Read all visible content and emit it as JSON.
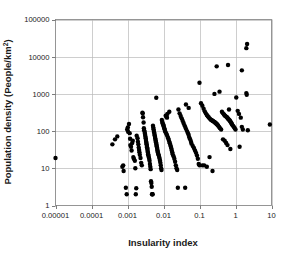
{
  "chart_data": {
    "type": "scatter",
    "title": "",
    "xlabel": "Insularity index",
    "ylabel": "Population density (People/km²)",
    "ylabel_base": "Population density (People/km",
    "ylabel_sup": "2",
    "ylabel_tail": ")",
    "xscale": "log",
    "yscale": "log",
    "xlim": [
      1e-05,
      10
    ],
    "ylim": [
      1,
      100000
    ],
    "grid": true,
    "legend": null,
    "xticks": [
      1e-05,
      0.0001,
      0.001,
      0.01,
      0.1,
      1,
      10
    ],
    "xtick_labels": [
      "0.00001",
      "0.0001",
      "0.001",
      "0.01",
      "0.1",
      "1",
      "10"
    ],
    "yticks": [
      1,
      10,
      100,
      1000,
      10000,
      100000
    ],
    "ytick_labels": [
      "1",
      "10",
      "100",
      "1000",
      "10000",
      "100000"
    ],
    "marker": "filled-circle",
    "marker_color": "#000000",
    "marker_size_px": 4.4,
    "n_points": 232,
    "points": [
      [
        1e-05,
        19
      ],
      [
        0.00038,
        44
      ],
      [
        0.00045,
        60
      ],
      [
        0.00052,
        72
      ],
      [
        0.00072,
        11
      ],
      [
        0.00076,
        12
      ],
      [
        0.00078,
        8.5
      ],
      [
        0.0009,
        3.0
      ],
      [
        0.00095,
        2.0
      ],
      [
        0.00098,
        110
      ],
      [
        0.00102,
        125
      ],
      [
        0.00104,
        96
      ],
      [
        0.0011,
        155
      ],
      [
        0.00115,
        88
      ],
      [
        0.00118,
        62
      ],
      [
        0.0012,
        42
      ],
      [
        0.00125,
        38
      ],
      [
        0.0013,
        30
      ],
      [
        0.00135,
        48
      ],
      [
        0.0014,
        55
      ],
      [
        0.00145,
        20
      ],
      [
        0.0015,
        18
      ],
      [
        0.0016,
        16
      ],
      [
        0.00165,
        10
      ],
      [
        0.0017,
        2.0
      ],
      [
        0.00175,
        2.9
      ],
      [
        0.0018,
        75
      ],
      [
        0.0019,
        64
      ],
      [
        0.00195,
        52
      ],
      [
        0.002,
        44
      ],
      [
        0.00205,
        36
      ],
      [
        0.0021,
        31
      ],
      [
        0.00215,
        27
      ],
      [
        0.0022,
        23
      ],
      [
        0.0023,
        19
      ],
      [
        0.0024,
        14
      ],
      [
        0.0025,
        12
      ],
      [
        0.0026,
        310
      ],
      [
        0.00265,
        300
      ],
      [
        0.0027,
        235
      ],
      [
        0.0028,
        170
      ],
      [
        0.00285,
        120
      ],
      [
        0.0029,
        105
      ],
      [
        0.003,
        95
      ],
      [
        0.00305,
        85
      ],
      [
        0.0031,
        78
      ],
      [
        0.00315,
        70
      ],
      [
        0.0032,
        64
      ],
      [
        0.00325,
        58
      ],
      [
        0.0033,
        52
      ],
      [
        0.00335,
        48
      ],
      [
        0.0034,
        44
      ],
      [
        0.00345,
        40
      ],
      [
        0.0035,
        37
      ],
      [
        0.00355,
        34
      ],
      [
        0.0036,
        31
      ],
      [
        0.00365,
        28
      ],
      [
        0.0037,
        26
      ],
      [
        0.00375,
        24
      ],
      [
        0.0038,
        22
      ],
      [
        0.0039,
        20
      ],
      [
        0.004,
        18
      ],
      [
        0.0041,
        16
      ],
      [
        0.0042,
        13
      ],
      [
        0.0043,
        11
      ],
      [
        0.0044,
        9.5
      ],
      [
        0.0045,
        4.5
      ],
      [
        0.0046,
        4.0
      ],
      [
        0.0047,
        3.2
      ],
      [
        0.0048,
        2.0
      ],
      [
        0.0049,
        2.0
      ],
      [
        0.005,
        2.0
      ],
      [
        0.0051,
        140
      ],
      [
        0.0052,
        125
      ],
      [
        0.0053,
        112
      ],
      [
        0.0054,
        100
      ],
      [
        0.0055,
        92
      ],
      [
        0.0056,
        84
      ],
      [
        0.0057,
        76
      ],
      [
        0.0058,
        70
      ],
      [
        0.0059,
        64
      ],
      [
        0.006,
        58
      ],
      [
        0.0061,
        54
      ],
      [
        0.0062,
        50
      ],
      [
        0.0063,
        46
      ],
      [
        0.0064,
        42
      ],
      [
        0.0065,
        39
      ],
      [
        0.0066,
        36
      ],
      [
        0.0067,
        33
      ],
      [
        0.0068,
        30
      ],
      [
        0.0069,
        28
      ],
      [
        0.007,
        26
      ],
      [
        0.0072,
        24
      ],
      [
        0.0074,
        22
      ],
      [
        0.0076,
        20
      ],
      [
        0.0078,
        18
      ],
      [
        0.008,
        16
      ],
      [
        0.0082,
        14
      ],
      [
        0.0084,
        12
      ],
      [
        0.0086,
        10
      ],
      [
        0.0088,
        9.0
      ],
      [
        0.0063,
        790
      ],
      [
        0.009,
        200
      ],
      [
        0.0092,
        175
      ],
      [
        0.0095,
        160
      ],
      [
        0.0098,
        150
      ],
      [
        0.01,
        142
      ],
      [
        0.0102,
        130
      ],
      [
        0.0105,
        120
      ],
      [
        0.0108,
        110
      ],
      [
        0.011,
        100
      ],
      [
        0.0115,
        92
      ],
      [
        0.012,
        85
      ],
      [
        0.0125,
        78
      ],
      [
        0.013,
        70
      ],
      [
        0.0135,
        64
      ],
      [
        0.014,
        58
      ],
      [
        0.0145,
        52
      ],
      [
        0.015,
        47
      ],
      [
        0.0155,
        42
      ],
      [
        0.016,
        38
      ],
      [
        0.0165,
        34
      ],
      [
        0.017,
        30
      ],
      [
        0.0175,
        27
      ],
      [
        0.018,
        24
      ],
      [
        0.019,
        21
      ],
      [
        0.02,
        18
      ],
      [
        0.021,
        15
      ],
      [
        0.022,
        12
      ],
      [
        0.023,
        10
      ],
      [
        0.024,
        9.0
      ],
      [
        0.0115,
        260
      ],
      [
        0.012,
        245
      ],
      [
        0.0125,
        230
      ],
      [
        0.0128,
        290
      ],
      [
        0.0145,
        330
      ],
      [
        0.025,
        3.0
      ],
      [
        0.04,
        3.0
      ],
      [
        0.026,
        380
      ],
      [
        0.028,
        300
      ],
      [
        0.03,
        255
      ],
      [
        0.032,
        220
      ],
      [
        0.034,
        190
      ],
      [
        0.036,
        165
      ],
      [
        0.038,
        145
      ],
      [
        0.04,
        130
      ],
      [
        0.042,
        115
      ],
      [
        0.045,
        100
      ],
      [
        0.048,
        88
      ],
      [
        0.05,
        78
      ],
      [
        0.052,
        68
      ],
      [
        0.055,
        60
      ],
      [
        0.058,
        52
      ],
      [
        0.06,
        46
      ],
      [
        0.065,
        40
      ],
      [
        0.07,
        35
      ],
      [
        0.075,
        30
      ],
      [
        0.08,
        26
      ],
      [
        0.085,
        22
      ],
      [
        0.09,
        18
      ],
      [
        0.095,
        13
      ],
      [
        0.1,
        12
      ],
      [
        0.042,
        520
      ],
      [
        0.05,
        420
      ],
      [
        0.1,
        2000
      ],
      [
        0.11,
        560
      ],
      [
        0.12,
        480
      ],
      [
        0.13,
        400
      ],
      [
        0.14,
        340
      ],
      [
        0.15,
        300
      ],
      [
        0.16,
        270
      ],
      [
        0.17,
        250
      ],
      [
        0.18,
        235
      ],
      [
        0.19,
        220
      ],
      [
        0.2,
        210
      ],
      [
        0.21,
        200
      ],
      [
        0.22,
        195
      ],
      [
        0.23,
        190
      ],
      [
        0.24,
        185
      ],
      [
        0.25,
        180
      ],
      [
        0.26,
        175
      ],
      [
        0.27,
        170
      ],
      [
        0.28,
        165
      ],
      [
        0.29,
        160
      ],
      [
        0.3,
        155
      ],
      [
        0.31,
        150
      ],
      [
        0.32,
        145
      ],
      [
        0.33,
        140
      ],
      [
        0.35,
        130
      ],
      [
        0.37,
        120
      ],
      [
        0.4,
        110
      ],
      [
        0.12,
        12
      ],
      [
        0.135,
        12
      ],
      [
        0.16,
        11
      ],
      [
        0.23,
        8.5
      ],
      [
        0.19,
        20
      ],
      [
        0.26,
        1000
      ],
      [
        0.3,
        5500
      ],
      [
        0.36,
        1150
      ],
      [
        0.42,
        330
      ],
      [
        0.45,
        300
      ],
      [
        0.48,
        280
      ],
      [
        0.5,
        265
      ],
      [
        0.52,
        255
      ],
      [
        0.55,
        245
      ],
      [
        0.58,
        235
      ],
      [
        0.6,
        225
      ],
      [
        0.62,
        215
      ],
      [
        0.65,
        205
      ],
      [
        0.68,
        195
      ],
      [
        0.7,
        190
      ],
      [
        0.72,
        180
      ],
      [
        0.75,
        170
      ],
      [
        0.78,
        160
      ],
      [
        0.8,
        150
      ],
      [
        0.85,
        140
      ],
      [
        0.9,
        130
      ],
      [
        0.95,
        120
      ],
      [
        1.0,
        110
      ],
      [
        0.45,
        60
      ],
      [
        0.5,
        55
      ],
      [
        0.55,
        48
      ],
      [
        0.6,
        42
      ],
      [
        0.72,
        33
      ],
      [
        0.62,
        6000
      ],
      [
        0.66,
        380
      ],
      [
        1.05,
        800
      ],
      [
        1.15,
        350
      ],
      [
        1.25,
        290
      ],
      [
        1.4,
        230
      ],
      [
        1.5,
        130
      ],
      [
        1.6,
        110
      ],
      [
        1.5,
        4300
      ],
      [
        1.3,
        38
      ],
      [
        2.0,
        17000
      ],
      [
        2.1,
        22000
      ],
      [
        2.0,
        1050
      ],
      [
        2.05,
        950
      ],
      [
        2.2,
        105
      ],
      [
        9.0,
        150
      ]
    ]
  },
  "caption": {
    "partial_text": ""
  }
}
